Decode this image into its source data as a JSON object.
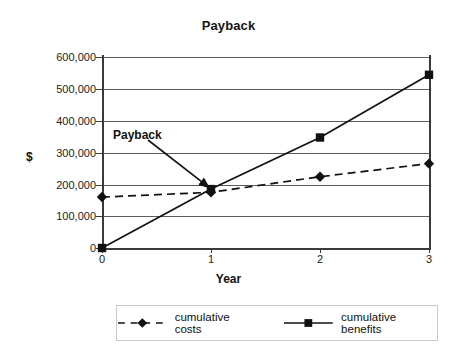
{
  "chart_data": {
    "type": "line",
    "title": "Payback",
    "xlabel": "Year",
    "ylabel": "$",
    "x": [
      0,
      1,
      2,
      3
    ],
    "categories": [
      "0",
      "1",
      "2",
      "3"
    ],
    "series": [
      {
        "name": "cumulative costs",
        "values": [
          160000,
          175000,
          224000,
          265000
        ],
        "style": "dashed",
        "marker": "diamond",
        "color": "#111111"
      },
      {
        "name": "cumulative benefits",
        "values": [
          0,
          185000,
          347000,
          544000
        ],
        "style": "solid",
        "marker": "square",
        "color": "#111111"
      }
    ],
    "ylim": [
      0,
      600000
    ],
    "xlim": [
      0,
      3
    ],
    "yticks": [
      0,
      100000,
      200000,
      300000,
      400000,
      500000,
      600000
    ],
    "ytick_labels": [
      "0",
      "100,000",
      "200,000",
      "300,000",
      "400,000",
      "500,000",
      "600,000"
    ],
    "xtick_labels": [
      "0",
      "1",
      "2",
      "3"
    ],
    "grid": "horizontal",
    "legend_position": "bottom",
    "annotations": [
      {
        "text": "Payback",
        "points_to_x": 1,
        "points_to_y": 180000
      }
    ]
  },
  "legend": {
    "items": [
      {
        "label": "cumulative costs",
        "marker": "diamond",
        "line": "dashed"
      },
      {
        "label": "cumulative benefits",
        "marker": "square",
        "line": "solid"
      }
    ]
  },
  "colors": {
    "axis": "#3b3b3b",
    "grid": "#5b5b5b",
    "series": "#111111",
    "background": "#ffffff"
  }
}
